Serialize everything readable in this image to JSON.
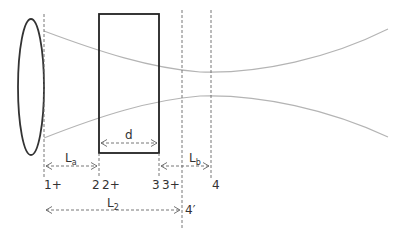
{
  "diagram": {
    "colors": {
      "lens": "#333333",
      "slab": "#222222",
      "beam": "#b4b4b4",
      "dashed": "#666666",
      "text": "#333333"
    },
    "dimensions": {
      "d": {
        "label": "d"
      },
      "La": {
        "label": "L",
        "sub": "a"
      },
      "Lb": {
        "label": "L",
        "sub": "b"
      },
      "L2": {
        "label": "L",
        "sub": "2"
      }
    },
    "planes": [
      {
        "id": "1+",
        "label": "1+"
      },
      {
        "id": "2",
        "label": "2"
      },
      {
        "id": "2+",
        "label": "2+"
      },
      {
        "id": "3",
        "label": "3"
      },
      {
        "id": "3+",
        "label": "3+"
      },
      {
        "id": "4",
        "label": "4"
      },
      {
        "id": "4prime",
        "label": "4′"
      }
    ]
  }
}
